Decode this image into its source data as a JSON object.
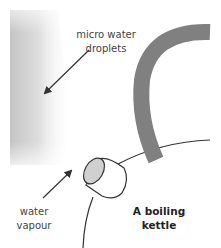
{
  "diagram": {
    "title": "A boiling kettle",
    "labels": {
      "droplets": "micro water droplets",
      "vapour": "water vapour",
      "kettle": "A boiling kettle"
    },
    "colors": {
      "handle": "#808080",
      "cloud": "#c8c8c8",
      "spout_opening": "#d0d0d0",
      "outline": "#333333",
      "text": "#444444"
    }
  }
}
